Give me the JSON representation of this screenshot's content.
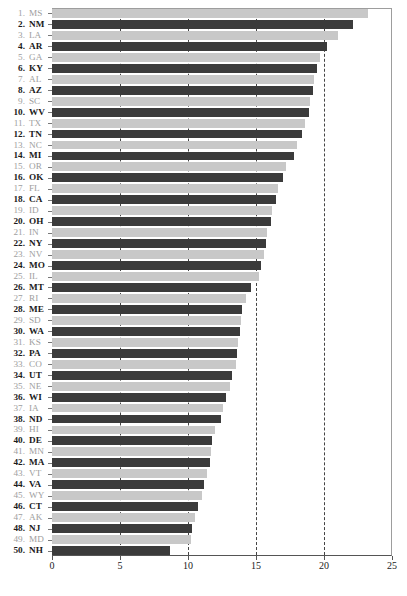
{
  "chart_data": {
    "type": "bar",
    "orientation": "horizontal",
    "title": "",
    "xlabel": "",
    "ylabel": "",
    "xlim": [
      0,
      25
    ],
    "ylim": [
      0,
      50
    ],
    "grid": "vertical dashed gridlines at 5, 10, 15, 20",
    "legend": "none",
    "xticks": [
      0,
      5,
      10,
      15,
      20,
      25
    ],
    "colors": {
      "odd_rank_bar": "#c8c8c8",
      "even_rank_bar": "#3b3b3b",
      "odd_rank_label": "#9e9e9e",
      "even_rank_label": "#1a1a1a",
      "gridline": "#444444",
      "axis": "#555555",
      "background": "#ffffff"
    },
    "categories": [
      "MS",
      "NM",
      "LA",
      "AR",
      "GA",
      "KY",
      "AL",
      "AZ",
      "SC",
      "WV",
      "TX",
      "TN",
      "NC",
      "MI",
      "OR",
      "OK",
      "FL",
      "CA",
      "ID",
      "OH",
      "IN",
      "NY",
      "NV",
      "MO",
      "IL",
      "MT",
      "RI",
      "ME",
      "SD",
      "WA",
      "KS",
      "PA",
      "CO",
      "UT",
      "NE",
      "WI",
      "IA",
      "ND",
      "HI",
      "DE",
      "MN",
      "MA",
      "VT",
      "VA",
      "WY",
      "CT",
      "AK",
      "NJ",
      "MD",
      "NH"
    ],
    "ranks": [
      1,
      2,
      3,
      4,
      5,
      6,
      7,
      8,
      9,
      10,
      11,
      12,
      13,
      14,
      15,
      16,
      17,
      18,
      19,
      20,
      21,
      22,
      23,
      24,
      25,
      26,
      27,
      28,
      29,
      30,
      31,
      32,
      33,
      34,
      35,
      36,
      37,
      38,
      39,
      40,
      41,
      42,
      43,
      44,
      45,
      46,
      47,
      48,
      49,
      50
    ],
    "values": [
      23.2,
      22.1,
      21.0,
      20.2,
      19.7,
      19.5,
      19.3,
      19.2,
      19.0,
      18.9,
      18.6,
      18.4,
      18.0,
      17.8,
      17.2,
      17.0,
      16.6,
      16.5,
      16.2,
      16.1,
      15.8,
      15.7,
      15.6,
      15.4,
      15.2,
      14.6,
      14.3,
      14.0,
      13.9,
      13.8,
      13.7,
      13.6,
      13.5,
      13.2,
      13.1,
      12.8,
      12.6,
      12.4,
      12.0,
      11.8,
      11.7,
      11.6,
      11.4,
      11.2,
      11.0,
      10.7,
      10.5,
      10.3,
      10.2,
      8.7
    ]
  }
}
